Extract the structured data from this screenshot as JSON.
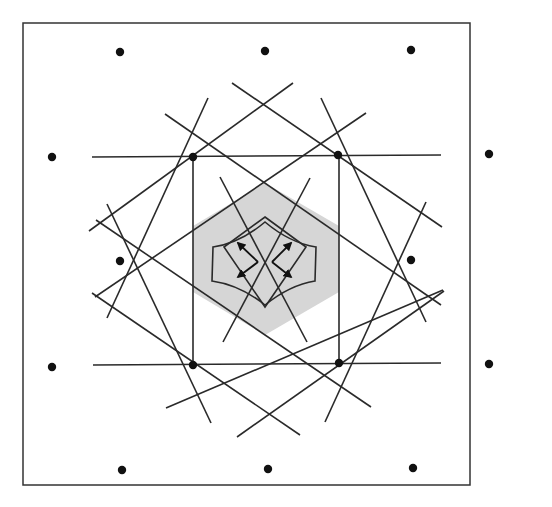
{
  "figure": {
    "type": "geometric-diagram",
    "colors": {
      "stroke": "#2a2a2a",
      "dot": "#111111",
      "shade": "#d6d6d6",
      "background": "#ffffff"
    },
    "frame": {
      "x1": 23,
      "y1": 23,
      "x2": 470,
      "y2": 485
    },
    "outer_dots": [
      {
        "x": 120,
        "y": 52
      },
      {
        "x": 265,
        "y": 51
      },
      {
        "x": 411,
        "y": 50
      },
      {
        "x": 52,
        "y": 157
      },
      {
        "x": 489,
        "y": 154
      },
      {
        "x": 120,
        "y": 261
      },
      {
        "x": 411,
        "y": 260
      },
      {
        "x": 52,
        "y": 367
      },
      {
        "x": 489,
        "y": 364
      },
      {
        "x": 122,
        "y": 470
      },
      {
        "x": 268,
        "y": 469
      },
      {
        "x": 413,
        "y": 468
      }
    ],
    "corner_dots": [
      {
        "x": 193,
        "y": 157
      },
      {
        "x": 338,
        "y": 155
      },
      {
        "x": 193,
        "y": 365
      },
      {
        "x": 339,
        "y": 363
      }
    ],
    "shaded_hexagon": "193,226 265,183 339,226 339,292 265,335 193,292",
    "inner_diamond": "265,247 265,247",
    "lines": [
      {
        "x1": 92,
        "y1": 157,
        "x2": 441,
        "y2": 155
      },
      {
        "x1": 93,
        "y1": 365,
        "x2": 441,
        "y2": 363
      },
      {
        "x1": 193,
        "y1": 157,
        "x2": 193,
        "y2": 365
      },
      {
        "x1": 339,
        "y1": 155,
        "x2": 339,
        "y2": 363
      },
      {
        "x1": 89,
        "y1": 231,
        "x2": 293,
        "y2": 83
      },
      {
        "x1": 232,
        "y1": 83,
        "x2": 442,
        "y2": 227
      },
      {
        "x1": 165,
        "y1": 114,
        "x2": 441,
        "y2": 305
      },
      {
        "x1": 95,
        "y1": 297,
        "x2": 366,
        "y2": 113
      },
      {
        "x1": 96,
        "y1": 220,
        "x2": 371,
        "y2": 407
      },
      {
        "x1": 166,
        "y1": 408,
        "x2": 443,
        "y2": 290
      },
      {
        "x1": 92,
        "y1": 293,
        "x2": 300,
        "y2": 435
      },
      {
        "x1": 237,
        "y1": 437,
        "x2": 444,
        "y2": 291
      },
      {
        "x1": 208,
        "y1": 98,
        "x2": 107,
        "y2": 318
      },
      {
        "x1": 321,
        "y1": 98,
        "x2": 426,
        "y2": 322
      },
      {
        "x1": 107,
        "y1": 204,
        "x2": 211,
        "y2": 423
      },
      {
        "x1": 426,
        "y1": 202,
        "x2": 325,
        "y2": 422
      },
      {
        "x1": 220,
        "y1": 177,
        "x2": 307,
        "y2": 342
      },
      {
        "x1": 310,
        "y1": 178,
        "x2": 223,
        "y2": 342
      }
    ],
    "inner_diamond_poly": "265,217 306,247 265,307 224,247",
    "concave_region_path": "M213,247 L212,281 Q240,285 265,305 Q290,285 315,281 L316,247 Q290,243 265,222 Q240,243 213,247 Z",
    "arrows": [
      {
        "x1": 258,
        "y1": 262,
        "x2": 238,
        "y2": 243
      },
      {
        "x1": 258,
        "y1": 262,
        "x2": 238,
        "y2": 277
      },
      {
        "x1": 272,
        "y1": 262,
        "x2": 291,
        "y2": 243
      },
      {
        "x1": 272,
        "y1": 262,
        "x2": 291,
        "y2": 277
      }
    ]
  }
}
